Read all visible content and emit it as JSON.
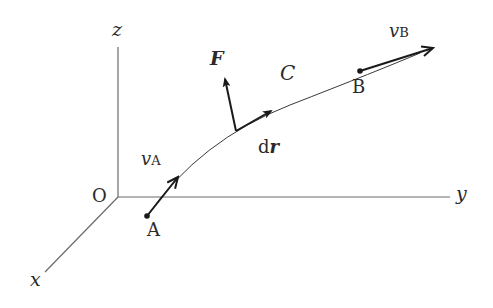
{
  "diagram": {
    "type": "3D coordinate system with particle trajectory",
    "axes": {
      "z_label": "z",
      "y_label": "y",
      "x_label": "x",
      "origin_label": "O"
    },
    "curve": {
      "label": "C"
    },
    "points": {
      "a_label": "A",
      "b_label": "B"
    },
    "vectors": {
      "force_label": "F",
      "displacement_prefix": "d",
      "displacement_var": "r",
      "velocity_a_base": "v",
      "velocity_a_sub": "A",
      "velocity_b_base": "v",
      "velocity_b_sub": "B"
    },
    "colors": {
      "axis": "#6a6a6a",
      "curve": "#3a3a3a",
      "vector": "#1a1a1a",
      "text": "#2a2a2a",
      "background": "#ffffff"
    }
  }
}
